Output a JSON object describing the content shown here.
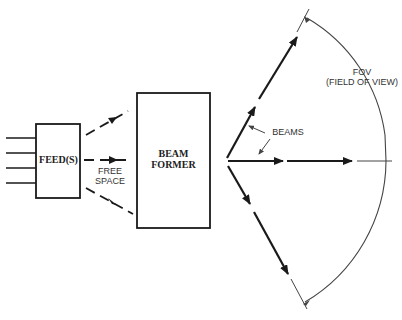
{
  "diagram": {
    "blocks": {
      "feed": "FEED(S)",
      "beam_former_line1": "BEAM",
      "beam_former_line2": "FORMER"
    },
    "labels": {
      "free_space_line1": "FREE",
      "free_space_line2": "SPACE",
      "beams": "BEAMS",
      "fov_line1": "FOV",
      "fov_line2": "(FIELD OF VIEW)"
    },
    "input_line_count": 4,
    "free_space_paths": 3,
    "output_beams": 3,
    "colors": {
      "stroke": "#1a1a1a",
      "thin_stroke": "#444444",
      "background": "#ffffff"
    }
  }
}
